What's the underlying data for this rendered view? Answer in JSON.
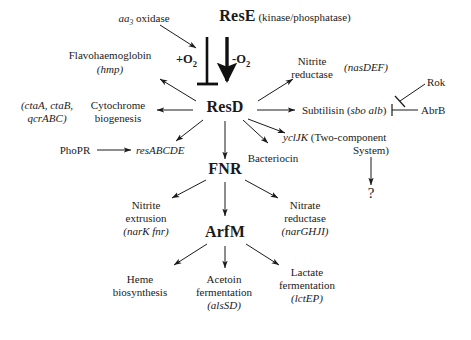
{
  "diagram": {
    "type": "regulatory-pathway",
    "nodes": {
      "aa3_oxidase": "aa",
      "aa3_oxidase_sub": "3",
      "aa3_oxidase_rest": " oxidase",
      "rese_name": "ResE",
      "rese_function": " (kinase/phosphatase)",
      "plus_o2": "+O",
      "plus_o2_sub": "2",
      "minus_o2": "-O",
      "minus_o2_sub": "2",
      "flavohaemoglobin": "Flavohaemoglobin",
      "flavohaemoglobin_gene": "(hmp)",
      "nitrite_reductase_l1": "Nitrite",
      "nitrite_reductase_l2": "reductase",
      "nitrite_reductase_gene": "(nasDEF)",
      "cytochrome_genes_l1": "(ctaA, ctaB,",
      "cytochrome_genes_l2": "qcrABC)",
      "cytochrome_l1": "Cytochrome",
      "cytochrome_l2": "biogenesis",
      "resd_name": "ResD",
      "subtilisin": "Subtilisin (",
      "subtilisin_gene": "sbo alb",
      "subtilisin_close": ")",
      "abrb": "AbrB",
      "rok": "Rok",
      "phopr": "PhoPR",
      "resabcde": "resABCDE",
      "bacteriocin": "Bacteriocin",
      "ycljk_gene": "yclJK",
      "ycljk_l1": " (Two-component",
      "ycljk_l2": "System)",
      "question_mark": "?",
      "fnr_name": "FNR",
      "nitrite_extrusion_l1": "Nitrite",
      "nitrite_extrusion_l2": "extrusion",
      "nitrite_extrusion_gene": "(narK fnr)",
      "nitrate_reductase_l1": "Nitrate",
      "nitrate_reductase_l2": "reductase",
      "nitrate_reductase_gene": "(narGHJI)",
      "arfm_name": "ArfM",
      "heme_l1": "Heme",
      "heme_l2": "biosynthesis",
      "acetoin_l1": "Acetoin",
      "acetoin_l2": "fermentation",
      "acetoin_gene": "(alsSD)",
      "lactate_l1": "Lactate",
      "lactate_l2": "fermentation",
      "lactate_gene": "(lctEP)"
    },
    "colors": {
      "ink": "#1a1a1a",
      "background": "#ffffff"
    }
  }
}
